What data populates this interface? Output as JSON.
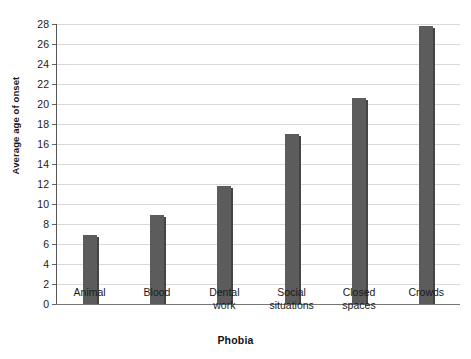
{
  "chart_data": {
    "type": "bar",
    "title": "",
    "xlabel": "Phobia",
    "ylabel": "Average age of onset",
    "categories": [
      "Animal",
      "Blood",
      "Dental work",
      "Social situations",
      "Closed spaces",
      "Crowds"
    ],
    "category_lines": [
      [
        "Animal"
      ],
      [
        "Blood"
      ],
      [
        "Dental",
        "work"
      ],
      [
        "Social",
        "situations"
      ],
      [
        "Closed",
        "spaces"
      ],
      [
        "Crowds"
      ]
    ],
    "values": [
      6.9,
      8.9,
      11.8,
      17.0,
      20.6,
      27.8
    ],
    "ylim": [
      0,
      28
    ],
    "ytick_step": 2,
    "yticks": [
      0,
      2,
      4,
      6,
      8,
      10,
      12,
      14,
      16,
      18,
      20,
      22,
      24,
      26,
      28
    ],
    "ytick_labels": [
      "0",
      "2",
      "4",
      "6",
      "8",
      "10",
      "12",
      "14",
      "16",
      "18",
      "20",
      "22",
      "24",
      "26",
      "28"
    ],
    "grid": true,
    "grid_axis": "y",
    "legend": false,
    "bar_color": "#5c5c5c",
    "bar_shadow_color": "#454545",
    "grid_color": "#d8d8d8",
    "axis_color": "#555555",
    "background_color": "#ffffff"
  }
}
